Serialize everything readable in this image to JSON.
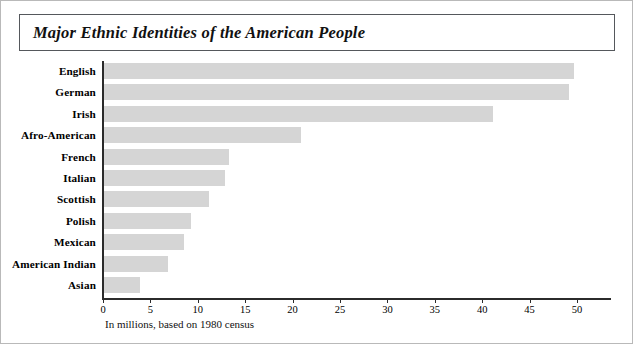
{
  "title": "Major Ethnic Identities of the American People",
  "caption": "In millions, based on 1980 census",
  "chart_data": {
    "type": "bar",
    "orientation": "horizontal",
    "title": "Major Ethnic Identities of the American People",
    "xlabel": "In millions, based on 1980 census",
    "ylabel": "",
    "xlim": [
      0,
      53.5
    ],
    "ticks": [
      0,
      5,
      10,
      15,
      20,
      25,
      30,
      35,
      40,
      45,
      50
    ],
    "tick_labels": [
      "0",
      "5",
      "10",
      "15",
      "20",
      "25",
      "30",
      "35",
      "40",
      "45",
      "50"
    ],
    "grid": false,
    "legend": "none",
    "bar_color": "#d5d5d5",
    "axis_color": "#2b2b2b",
    "categories": [
      "English",
      "German",
      "Irish",
      "Afro-American",
      "French",
      "Italian",
      "Scottish",
      "Polish",
      "Mexican",
      "American Indian",
      "Asian"
    ],
    "values": [
      49.6,
      49.0,
      41.0,
      20.8,
      13.2,
      12.8,
      11.1,
      9.2,
      8.4,
      6.7,
      3.8
    ]
  }
}
